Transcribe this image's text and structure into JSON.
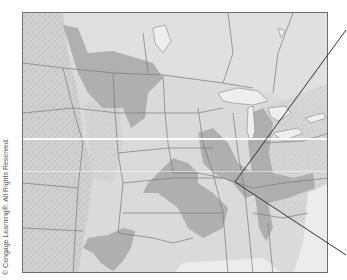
{
  "map": {
    "title": "",
    "region": "Central and Eastern United States with southern Canada",
    "style": "grayscale shaded-relief political map",
    "colors": {
      "background": "#d9d9d9",
      "land_light": "#dedede",
      "relief_west": "#cfcfcf",
      "shaded_zone": "#a9a9a9",
      "water": "#efefef",
      "borders": "#777777",
      "frame": "#6e6e6e",
      "callout_lines": "#333333"
    },
    "shaded_zones": [
      "Northern Plains / Montana–Dakotas zone",
      "Southern Plains zone (Kansas–Oklahoma)",
      "Midwest zone (Iowa–Illinois–Missouri)",
      "Ohio Valley / Michigan zone",
      "Texas zone"
    ],
    "callout": {
      "origin_point": [
        235,
        182
      ],
      "upper_line_end": [
        346,
        30
      ],
      "lower_line_end": [
        346,
        255
      ]
    }
  },
  "copyright": "© Cengage Learning®. All Rights Reserved."
}
